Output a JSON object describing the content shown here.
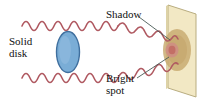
{
  "figure": {
    "name": "poisson-bright-spot-diagram",
    "type": "physics-diagram",
    "width": 199,
    "height": 104,
    "background": "#ffffff"
  },
  "labels": {
    "solid_disk": {
      "line1": "Solid",
      "line2": "disk"
    },
    "shadow": {
      "line1": "Shadow"
    },
    "bright_spot": {
      "line1": "Bright",
      "line2": "spot"
    }
  },
  "colors": {
    "wave": "#b05a62",
    "disk_fill": "#7aadd6",
    "disk_edge": "#3d6e9e",
    "screen_fill": "#f2e8c4",
    "screen_edge": "#b3a878",
    "shadow_fill": "#c9ab72",
    "bright_spot": "#c97a74",
    "leader_line": "#4a5a56",
    "text": "#111111"
  },
  "elements": {
    "screen": {
      "name": "projection-screen",
      "shape": "parallelogram",
      "points": "168,5 196,14 196,97 168,88"
    },
    "disk": {
      "name": "solid-disk",
      "shape": "ellipse",
      "cx": 68,
      "cy": 52,
      "rx": 11,
      "ry": 20
    },
    "shadow": {
      "name": "shadow-region",
      "shape": "ellipse",
      "cx": 176,
      "cy": 50,
      "rx": 14,
      "ry": 21
    },
    "bright_spot": {
      "name": "bright-spot",
      "shape": "ellipse",
      "cx": 172,
      "cy": 50,
      "rx": 5,
      "ry": 6
    },
    "waves": [
      {
        "name": "upper-wavefront",
        "path": "travels left-to-right above the disk then angles down to the bright spot"
      },
      {
        "name": "lower-wavefront",
        "path": "travels left-to-right below the disk then angles up to the bright spot"
      }
    ],
    "leaders": [
      {
        "name": "shadow-leader-line",
        "from": "Shadow label",
        "to": "shadow region"
      },
      {
        "name": "bright-spot-leader-line",
        "from": "Bright spot label",
        "to": "bright spot"
      }
    ]
  }
}
